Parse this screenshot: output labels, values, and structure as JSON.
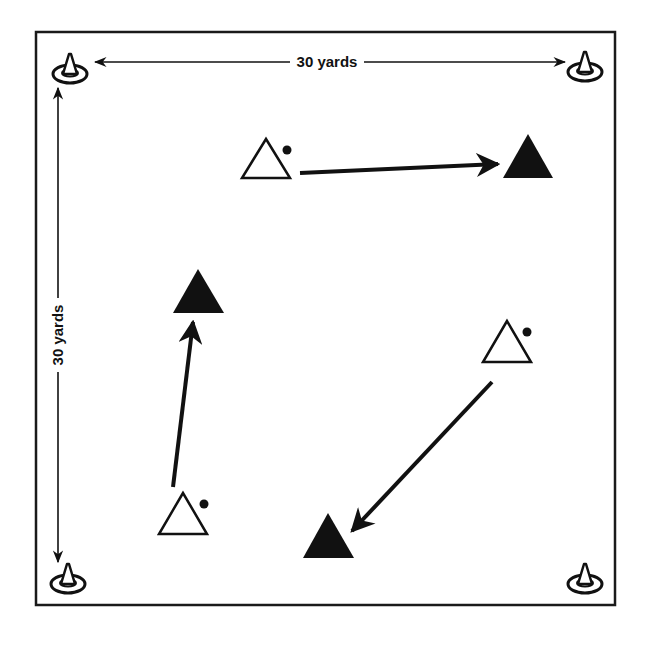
{
  "diagram": {
    "title": "",
    "field": {
      "x": 36,
      "y": 32,
      "width": 579,
      "height": 573,
      "stroke": "#1a1a1a"
    },
    "dimensions": {
      "horizontal": {
        "label": "30 yards",
        "y": 62,
        "x1": 95,
        "x2": 565,
        "label_x": 323
      },
      "vertical": {
        "label": "30 yards",
        "x": 58,
        "y1": 88,
        "y2": 562,
        "label_y": 335
      }
    },
    "cones": [
      {
        "id": "cone-top-left",
        "x": 70,
        "y": 70
      },
      {
        "id": "cone-top-right",
        "x": 585,
        "y": 68
      },
      {
        "id": "cone-bottom-left",
        "x": 68,
        "y": 580
      },
      {
        "id": "cone-bottom-right",
        "x": 585,
        "y": 580
      }
    ],
    "groups": [
      {
        "passer": {
          "x": 266,
          "y": 160,
          "ball": {
            "x": 287,
            "y": 150
          }
        },
        "receiver": {
          "x": 528,
          "y": 157
        },
        "pass_arrow": {
          "x1": 300,
          "y1": 173,
          "x2": 498,
          "y2": 164
        }
      },
      {
        "passer": {
          "x": 183,
          "y": 515,
          "ball": {
            "x": 204,
            "y": 504
          }
        },
        "receiver": {
          "x": 198,
          "y": 292
        },
        "pass_arrow": {
          "x1": 173,
          "y1": 487,
          "x2": 193,
          "y2": 320
        }
      },
      {
        "passer": {
          "x": 507,
          "y": 343,
          "ball": {
            "x": 527,
            "y": 332
          }
        },
        "receiver": {
          "x": 328,
          "y": 537
        },
        "pass_arrow": {
          "x1": 492,
          "y1": 382,
          "x2": 352,
          "y2": 531
        }
      }
    ],
    "legend": {
      "open_triangle": "player with ball (passer)",
      "filled_triangle": "receiving player",
      "dot": "ball",
      "cone": "field marker cone"
    },
    "colors": {
      "ink": "#111111",
      "background": "#ffffff"
    }
  }
}
